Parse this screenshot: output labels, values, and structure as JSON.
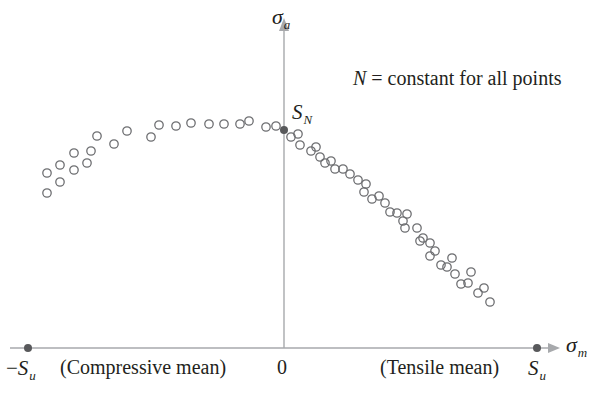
{
  "chart_data": {
    "type": "scatter",
    "title": "",
    "annotation": "N = constant for all points",
    "xlabel": "σm",
    "ylabel": "σa",
    "x_tick_labels": [
      "−Su",
      "0",
      "Su"
    ],
    "region_labels": {
      "left": "(Compressive mean)",
      "right": "(Tensile mean)"
    },
    "point_labels": {
      "sn": "SN"
    },
    "grid": false,
    "legend": null,
    "units": "normalized: x in units of Su (−1..1), y in units of SN",
    "xlim": [
      -1.1,
      1.2
    ],
    "ylim": [
      0,
      1.2
    ],
    "special_points": [
      {
        "name": "-Su",
        "x": -1.0,
        "y": 0.0
      },
      {
        "name": "Su",
        "x": 1.0,
        "y": 0.0
      },
      {
        "name": "SN",
        "x": 0.0,
        "y": 1.0
      }
    ],
    "series": [
      {
        "name": "test data (compressive mean)",
        "marker": "open-circle",
        "points_px": [
          [
            47,
            193
          ],
          [
            47,
            173
          ],
          [
            60,
            182
          ],
          [
            60,
            165
          ],
          [
            74,
            170
          ],
          [
            74,
            153
          ],
          [
            87,
            163
          ],
          [
            91,
            151
          ],
          [
            97,
            136
          ],
          [
            114,
            144
          ],
          [
            127,
            131
          ],
          [
            151,
            137
          ],
          [
            159,
            125
          ],
          [
            176,
            126
          ],
          [
            191,
            123
          ],
          [
            209,
            124
          ],
          [
            224,
            124
          ],
          [
            240,
            124
          ],
          [
            249,
            121
          ],
          [
            266,
            127
          ],
          [
            276,
            126
          ]
        ]
      },
      {
        "name": "test data (tensile mean)",
        "marker": "open-circle",
        "points_px": [
          [
            291,
            137
          ],
          [
            298,
            134
          ],
          [
            300,
            145
          ],
          [
            311,
            151
          ],
          [
            316,
            147
          ],
          [
            320,
            157
          ],
          [
            325,
            163
          ],
          [
            331,
            161
          ],
          [
            335,
            169
          ],
          [
            343,
            169
          ],
          [
            350,
            174
          ],
          [
            358,
            180
          ],
          [
            364,
            192
          ],
          [
            366,
            184
          ],
          [
            372,
            199
          ],
          [
            379,
            196
          ],
          [
            385,
            203
          ],
          [
            390,
            212
          ],
          [
            397,
            213
          ],
          [
            403,
            221
          ],
          [
            405,
            228
          ],
          [
            407,
            214
          ],
          [
            417,
            228
          ],
          [
            420,
            241
          ],
          [
            423,
            238
          ],
          [
            430,
            243
          ],
          [
            430,
            256
          ],
          [
            435,
            251
          ],
          [
            441,
            265
          ],
          [
            447,
            267
          ],
          [
            452,
            258
          ],
          [
            455,
            274
          ],
          [
            461,
            284
          ],
          [
            468,
            283
          ],
          [
            471,
            272
          ],
          [
            478,
            293
          ],
          [
            484,
            288
          ],
          [
            490,
            302
          ]
        ]
      }
    ]
  },
  "colors": {
    "axis": "#a7a9ac",
    "marker_stroke": "#6d6e71",
    "special_point": "#58595b",
    "text": "#231f20"
  },
  "labels": {
    "y_axis_symbol": "σ",
    "y_axis_sub": "a",
    "x_axis_symbol": "σ",
    "x_axis_sub": "m",
    "sn_symbol": "S",
    "sn_sub": "N",
    "neg_su_prefix": "−",
    "neg_su_symbol": "S",
    "neg_su_sub": "u",
    "su_symbol": "S",
    "su_sub": "u",
    "zero": "0",
    "compressive": "(Compressive mean)",
    "tensile": "(Tensile mean)",
    "annotation_var": "N",
    "annotation_rest": " = constant for all points"
  }
}
